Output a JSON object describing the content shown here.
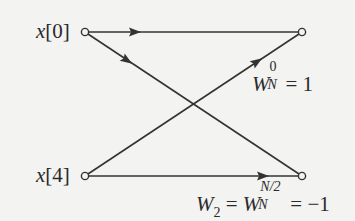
{
  "diagram": {
    "type": "butterfly-signal-flow-graph",
    "inputs": [
      {
        "label": "x[0]",
        "var": "x",
        "index": "[0]"
      },
      {
        "label": "x[4]",
        "var": "x",
        "index": "[4]"
      }
    ],
    "branch_labels": {
      "upper": {
        "base": "W",
        "sub": "N",
        "sup": "0",
        "rhs": "= 1"
      },
      "lower": {
        "lhs_base": "W",
        "lhs_sub": "2",
        "eq": "=",
        "base": "W",
        "sub": "N",
        "sup": "N/2",
        "rhs": "= −1"
      }
    },
    "nodes": [
      {
        "id": "in0",
        "x": 85,
        "y": 32
      },
      {
        "id": "in4",
        "x": 85,
        "y": 176
      },
      {
        "id": "out0",
        "x": 302,
        "y": 32
      },
      {
        "id": "out1",
        "x": 302,
        "y": 176
      }
    ],
    "edges": [
      {
        "from": "in0",
        "to": "out0",
        "direction": "horizontal-top"
      },
      {
        "from": "in0",
        "to": "out1",
        "direction": "diagonal-down"
      },
      {
        "from": "in4",
        "to": "out0",
        "direction": "diagonal-up"
      },
      {
        "from": "in4",
        "to": "out1",
        "direction": "horizontal-bottom"
      }
    ]
  }
}
